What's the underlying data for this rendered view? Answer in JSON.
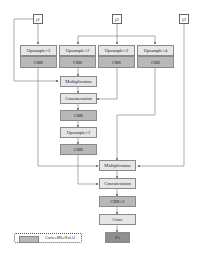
{
  "inputs": [
    {
      "label": "f1",
      "x": 33,
      "y": 14
    },
    {
      "label": "f2",
      "x": 112,
      "y": 14
    },
    {
      "label": "f3",
      "x": 179,
      "y": 14
    }
  ],
  "upsample_row": [
    {
      "label": "Upsample×2",
      "cbr": "CBR"
    },
    {
      "label": "Upsample×2",
      "cbr": "CBR"
    },
    {
      "label": "Upsample×2",
      "cbr": "CBR"
    },
    {
      "label": "Upsample×4",
      "cbr": "CBR"
    }
  ],
  "branch1": {
    "multiplication": "Multiplication",
    "concatenation": "Concatenation",
    "cbr": "CBR",
    "upsample": "Upsample×2",
    "cbr2": "CBR"
  },
  "branch2": {
    "multiplication": "Multiplication",
    "concatenation": "Concatenation",
    "cbr_x2": "CBR×2",
    "conv": "Conv",
    "output": "Fs"
  },
  "legend": {
    "text": "Conv+BN+ReLU"
  },
  "colors": {
    "light_box": "#e6e6e6",
    "cbr_box": "#b8b8b8",
    "output_box": "#8f8f8f",
    "line": "#777777"
  }
}
